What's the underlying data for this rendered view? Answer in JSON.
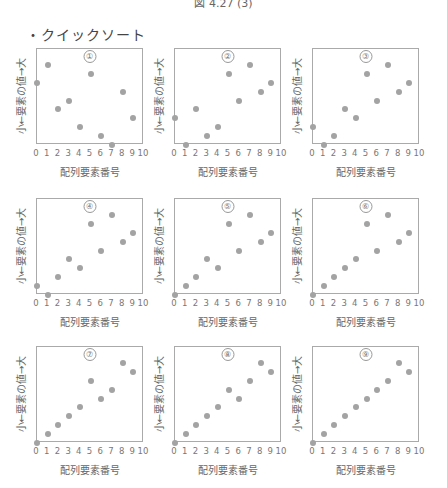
{
  "figure": {
    "caption": "図 4.27 (3)",
    "section_title": "・クイックソート"
  },
  "axes": {
    "xlabel": "配列要素番号",
    "ylabel": "小←要素の値→大",
    "xticks": [
      "0",
      "1",
      "2",
      "3",
      "4",
      "5",
      "6",
      "7",
      "8",
      "9",
      "10"
    ]
  },
  "chart_data": [
    {
      "type": "scatter",
      "title": "①",
      "x": [
        0,
        1,
        2,
        3,
        4,
        5,
        6,
        7,
        8,
        9
      ],
      "y": [
        7,
        9,
        4,
        5,
        2,
        8,
        1,
        0,
        6,
        3
      ],
      "xlabel": "配列要素番号",
      "ylabel": "小←要素の値→大",
      "xlim": [
        0,
        10
      ],
      "ylim": [
        0,
        10.8
      ],
      "grid": false
    },
    {
      "type": "scatter",
      "title": "②",
      "x": [
        0,
        1,
        2,
        3,
        4,
        5,
        6,
        7,
        8,
        9
      ],
      "y": [
        3,
        0,
        4,
        1,
        2,
        8,
        5,
        9,
        6,
        7
      ],
      "xlabel": "配列要素番号",
      "ylabel": "小←要素の値→大",
      "xlim": [
        0,
        10
      ],
      "ylim": [
        0,
        10.8
      ],
      "grid": false
    },
    {
      "type": "scatter",
      "title": "③",
      "x": [
        0,
        1,
        2,
        3,
        4,
        5,
        6,
        7,
        8,
        9
      ],
      "y": [
        2,
        0,
        1,
        4,
        3,
        8,
        5,
        9,
        6,
        7
      ],
      "xlabel": "配列要素番号",
      "ylabel": "小←要素の値→大",
      "xlim": [
        0,
        10
      ],
      "ylim": [
        0,
        10.8
      ],
      "grid": false
    },
    {
      "type": "scatter",
      "title": "④",
      "x": [
        0,
        1,
        2,
        3,
        4,
        5,
        6,
        7,
        8,
        9
      ],
      "y": [
        1,
        0,
        2,
        4,
        3,
        8,
        5,
        9,
        6,
        7
      ],
      "xlabel": "配列要素番号",
      "ylabel": "小←要素の値→大",
      "xlim": [
        0,
        10
      ],
      "ylim": [
        0,
        10.8
      ],
      "grid": false
    },
    {
      "type": "scatter",
      "title": "⑤",
      "x": [
        0,
        1,
        2,
        3,
        4,
        5,
        6,
        7,
        8,
        9
      ],
      "y": [
        0,
        1,
        2,
        4,
        3,
        8,
        5,
        9,
        6,
        7
      ],
      "xlabel": "配列要素番号",
      "ylabel": "小←要素の値→大",
      "xlim": [
        0,
        10
      ],
      "ylim": [
        0,
        10.8
      ],
      "grid": false
    },
    {
      "type": "scatter",
      "title": "⑥",
      "x": [
        0,
        1,
        2,
        3,
        4,
        5,
        6,
        7,
        8,
        9
      ],
      "y": [
        0,
        1,
        2,
        3,
        4,
        8,
        5,
        9,
        6,
        7
      ],
      "xlabel": "配列要素番号",
      "ylabel": "小←要素の値→大",
      "xlim": [
        0,
        10
      ],
      "ylim": [
        0,
        10.8
      ],
      "grid": false
    },
    {
      "type": "scatter",
      "title": "⑦",
      "x": [
        0,
        1,
        2,
        3,
        4,
        5,
        6,
        7,
        8,
        9
      ],
      "y": [
        0,
        1,
        2,
        3,
        4,
        7,
        5,
        6,
        9,
        8
      ],
      "xlabel": "配列要素番号",
      "ylabel": "小←要素の値→大",
      "xlim": [
        0,
        10
      ],
      "ylim": [
        0,
        10.8
      ],
      "grid": false
    },
    {
      "type": "scatter",
      "title": "⑧",
      "x": [
        0,
        1,
        2,
        3,
        4,
        5,
        6,
        7,
        8,
        9
      ],
      "y": [
        0,
        1,
        2,
        3,
        4,
        6,
        5,
        7,
        9,
        8
      ],
      "xlabel": "配列要素番号",
      "ylabel": "小←要素の値→大",
      "xlim": [
        0,
        10
      ],
      "ylim": [
        0,
        10.8
      ],
      "grid": false
    },
    {
      "type": "scatter",
      "title": "⑨",
      "x": [
        0,
        1,
        2,
        3,
        4,
        5,
        6,
        7,
        8,
        9
      ],
      "y": [
        0,
        1,
        2,
        3,
        4,
        5,
        6,
        7,
        9,
        8
      ],
      "xlabel": "配列要素番号",
      "ylabel": "小←要素の値→大",
      "xlim": [
        0,
        10
      ],
      "ylim": [
        0,
        10.8
      ],
      "grid": false
    }
  ],
  "colors": {
    "dot": "#a3a3a3",
    "frame": "#aaaaaa"
  }
}
